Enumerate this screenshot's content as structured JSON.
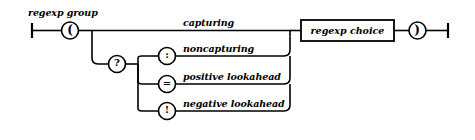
{
  "diagram": {
    "title": "regexp group",
    "type": "railroad-syntax-diagram",
    "start_marker": "track-start-icon",
    "end_marker": "track-end-icon",
    "stroke_color": "#000000",
    "background_color": "#ffffff",
    "open_paren": {
      "glyph": "(",
      "icon_name": "open-paren-terminal"
    },
    "question_mark": {
      "glyph": "?",
      "icon_name": "question-mark-terminal"
    },
    "close_paren": {
      "glyph": ")",
      "icon_name": "close-paren-terminal"
    },
    "branches": [
      {
        "id": "capturing",
        "label": "capturing",
        "token": null,
        "token_name": null
      },
      {
        "id": "noncapturing",
        "label": "noncapturing",
        "token": ":",
        "token_name": "colon-terminal"
      },
      {
        "id": "positive-lookahead",
        "label": "positive lookahead",
        "token": "=",
        "token_name": "equals-terminal"
      },
      {
        "id": "negative-lookahead",
        "label": "negative lookahead",
        "token": "!",
        "token_name": "exclamation-terminal"
      }
    ],
    "nonterminal": {
      "label": "regexp choice"
    }
  }
}
